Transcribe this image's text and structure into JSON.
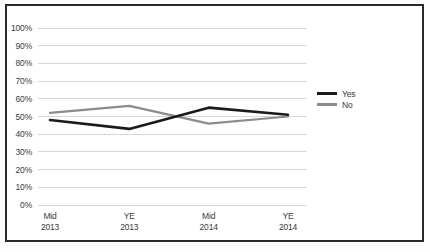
{
  "chart_data": {
    "type": "line",
    "title": "",
    "subtitle": "",
    "xlabel": "",
    "ylabel": "",
    "categories": [
      "Mid 2013",
      "YE 2013",
      "Mid 2014",
      "YE 2014"
    ],
    "category_lines": [
      [
        "Mid",
        "2013"
      ],
      [
        "YE",
        "2013"
      ],
      [
        "Mid",
        "2014"
      ],
      [
        "YE",
        "2014"
      ]
    ],
    "series": [
      {
        "name": "Yes",
        "values": [
          48,
          43,
          55,
          51
        ],
        "color": "#1a1a1a"
      },
      {
        "name": "No",
        "values": [
          52,
          56,
          46,
          50
        ],
        "color": "#8c8c8c"
      }
    ],
    "ylim": [
      0,
      100
    ],
    "ytick_values": [
      0,
      10,
      20,
      30,
      40,
      50,
      60,
      70,
      80,
      90,
      100
    ],
    "ytick_labels": [
      "0%",
      "10%",
      "20%",
      "30%",
      "40%",
      "50%",
      "60%",
      "70%",
      "80%",
      "90%",
      "100%"
    ],
    "grid": {
      "horizontal": true,
      "vertical": false,
      "color": "#d8d8d8"
    },
    "legend": {
      "position": "right",
      "entries": [
        "Yes",
        "No"
      ]
    },
    "annotations": []
  },
  "colors": {
    "yes_series": "#1a1a1a",
    "no_series": "#8c8c8c",
    "gridline": "#d8d8d8",
    "frame_border": "#2a2a2a",
    "tick_text": "#3a3a3a",
    "background": "#ffffff"
  }
}
